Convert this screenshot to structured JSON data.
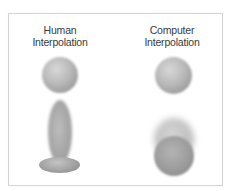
{
  "figure": {
    "columns": [
      {
        "title_lines": [
          "Human",
          "Interpolation"
        ],
        "frames": [
          "round ball",
          "stretched ball (motion blur)",
          "squashed ball on ground"
        ]
      },
      {
        "title_lines": [
          "Computer",
          "Interpolation"
        ],
        "frames": [
          "round ball",
          "overlapping blurred balls"
        ]
      }
    ],
    "colors": {
      "border": "#d4d4d4",
      "text": "#3a3a3a",
      "ball": "#b0b0b0"
    }
  }
}
